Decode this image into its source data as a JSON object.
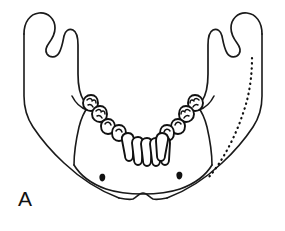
{
  "figure": {
    "panel_label": "A",
    "view": "anterior-superior oblique view",
    "style": "black-and-white line drawing",
    "background_color": "#ffffff",
    "ink_color": "#111111"
  },
  "anatomy": {
    "structures": [
      {
        "name": "left-coronoid-process",
        "side": "left",
        "label": ""
      },
      {
        "name": "left-mandibular-notch",
        "side": "left",
        "label": ""
      },
      {
        "name": "left-condylar-process",
        "side": "left",
        "label": ""
      },
      {
        "name": "left-ramus",
        "side": "left",
        "label": ""
      },
      {
        "name": "left-angle-of-mandible",
        "side": "left",
        "label": ""
      },
      {
        "name": "right-coronoid-process",
        "side": "right",
        "label": ""
      },
      {
        "name": "right-mandibular-notch",
        "side": "right",
        "label": ""
      },
      {
        "name": "right-condylar-process",
        "side": "right",
        "label": ""
      },
      {
        "name": "right-ramus",
        "side": "right",
        "label": ""
      },
      {
        "name": "right-angle-of-mandible",
        "side": "right",
        "label": ""
      },
      {
        "name": "body-of-mandible",
        "side": "both",
        "label": ""
      },
      {
        "name": "mental-protuberance",
        "side": "center",
        "label": ""
      },
      {
        "name": "alveolar-arch",
        "side": "both",
        "label": ""
      }
    ],
    "mental_foramina": [
      {
        "name": "left-mental-foramen",
        "cx": 103,
        "cy": 177
      },
      {
        "name": "right-mental-foramen",
        "cx": 180,
        "cy": 175
      }
    ],
    "mandibular_canal": {
      "name": "mandibular-canal",
      "side": "right",
      "rendering": "dotted line",
      "label": ""
    }
  },
  "dentition": {
    "arch": "mandibular",
    "left_posterior_teeth": [
      {
        "type": "molar",
        "shape": "round-cusped"
      },
      {
        "type": "molar",
        "shape": "round-cusped"
      },
      {
        "type": "premolar",
        "shape": "rounded"
      },
      {
        "type": "premolar",
        "shape": "rounded"
      }
    ],
    "anterior_teeth": [
      {
        "type": "canine",
        "shape": "narrow-pointed"
      },
      {
        "type": "incisor",
        "shape": "narrow-blade"
      },
      {
        "type": "incisor",
        "shape": "narrow-blade"
      },
      {
        "type": "incisor",
        "shape": "narrow-blade"
      },
      {
        "type": "incisor",
        "shape": "narrow-blade"
      },
      {
        "type": "canine",
        "shape": "narrow-pointed"
      }
    ],
    "right_posterior_teeth": [
      {
        "type": "premolar",
        "shape": "rounded"
      },
      {
        "type": "premolar",
        "shape": "rounded"
      },
      {
        "type": "molar",
        "shape": "round-cusped"
      },
      {
        "type": "molar",
        "shape": "round-cusped"
      }
    ]
  }
}
